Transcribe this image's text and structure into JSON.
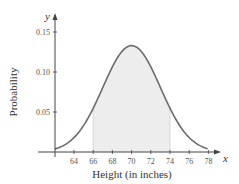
{
  "chart_data": {
    "type": "area",
    "title": "",
    "xlabel": "Height (in inches)",
    "ylabel": "Probability",
    "x_axis_var": "x",
    "y_axis_var": "y",
    "xlim": [
      62,
      79
    ],
    "ylim": [
      0,
      0.16
    ],
    "x_ticks": [
      64,
      66,
      68,
      70,
      72,
      74,
      76,
      78
    ],
    "y_ticks": [
      0.05,
      0.1,
      0.15
    ],
    "y_tick_labels": [
      "0.05",
      "0.10",
      "0.15"
    ],
    "distribution": {
      "name": "normal",
      "mean": 70,
      "sd": 3
    },
    "shaded_region": {
      "from": 66,
      "to": 74
    },
    "curve_range": [
      62,
      78
    ],
    "grid": false,
    "colors": {
      "curve": "#6b6b6b",
      "shade": "#ededed",
      "axis": "#444444"
    }
  }
}
